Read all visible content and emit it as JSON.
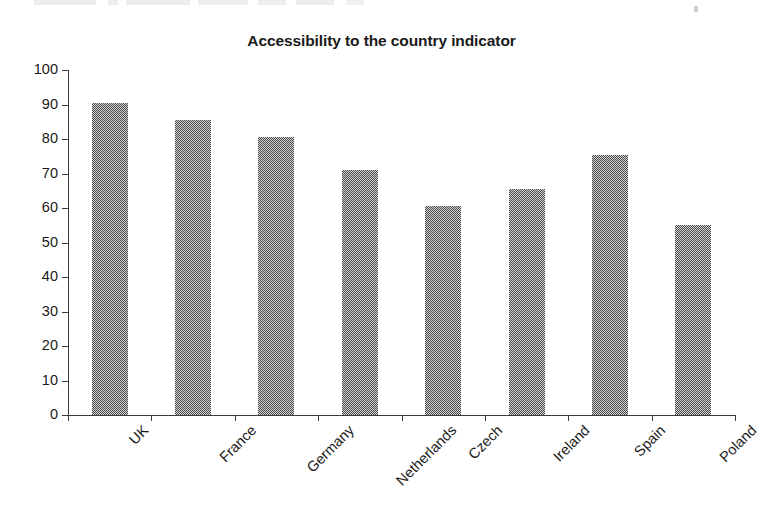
{
  "chart_data": {
    "type": "bar",
    "title": "Accessibility to the country indicator",
    "xlabel": "",
    "ylabel": "",
    "categories": [
      "UK",
      "France",
      "Germany",
      "Netherlands",
      "Czech",
      "Ireland",
      "Spain",
      "Poland"
    ],
    "values": [
      90.5,
      85.5,
      80.5,
      71,
      60.5,
      65.5,
      75.5,
      55
    ],
    "ylim": [
      0,
      100
    ],
    "y_ticks": [
      0,
      10,
      20,
      30,
      40,
      50,
      60,
      70,
      80,
      90,
      100
    ],
    "y_tick_labels": [
      "0",
      "10",
      "20",
      "30",
      "40",
      "50",
      "60",
      "70",
      "80",
      "90",
      "100"
    ],
    "grid": false,
    "legend": false,
    "series": [
      {
        "name": "Accessibility to the country indicator",
        "values": [
          90.5,
          85.5,
          80.5,
          71,
          60.5,
          65.5,
          75.5,
          55
        ],
        "color": "#808080",
        "fill_pattern": "50-percent-dither-gray"
      }
    ],
    "x_tick_label_rotation": -45,
    "colors": {
      "bar_fill": "#808080",
      "axis": "#3a3a3a",
      "text": "#1a1a1a",
      "background": "#ffffff"
    }
  }
}
